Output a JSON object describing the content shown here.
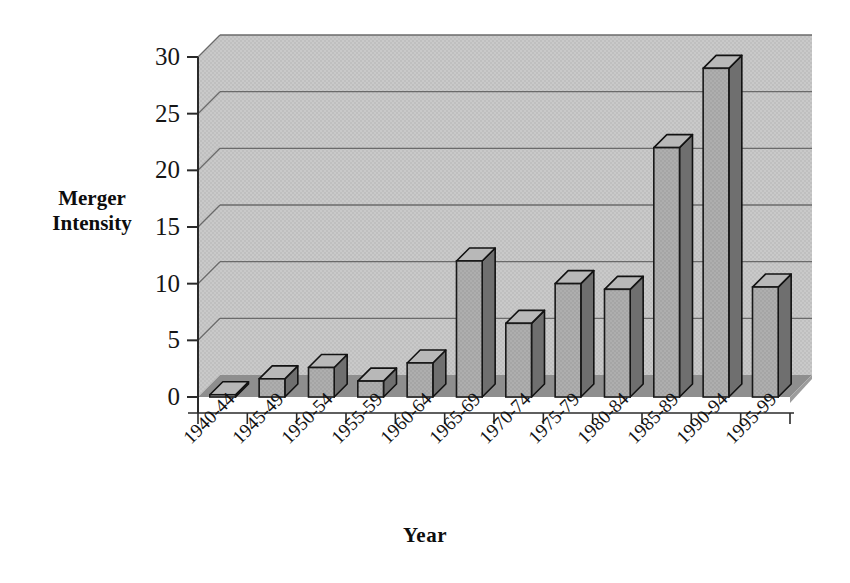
{
  "chart_data": {
    "type": "bar",
    "title": "",
    "subtitle": "",
    "xlabel": "Year",
    "ylabel": "Merger Intensity",
    "ylabel_lines": [
      "Merger",
      "Intensity"
    ],
    "categories": [
      "1940-44",
      "1945-49",
      "1950-54",
      "1955-59",
      "1960-64",
      "1965-69",
      "1970-74",
      "1975-79",
      "1980-84",
      "1985-89",
      "1990-94",
      "1995-99"
    ],
    "values": [
      0.2,
      1.6,
      2.6,
      1.4,
      3.0,
      12.0,
      6.5,
      10.0,
      9.5,
      22.0,
      29.0,
      9.7
    ],
    "ylim": [
      0,
      30
    ],
    "yticks": [
      0,
      5,
      10,
      15,
      20,
      25,
      30
    ],
    "ytick_labels": [
      "0",
      "5",
      "10",
      "15",
      "20",
      "25",
      "30"
    ],
    "grid": true,
    "grid_axis": "y",
    "legend": false,
    "legend_position": "none",
    "style": "3d-column",
    "series": [
      {
        "name": "Merger Intensity",
        "values": [
          0.2,
          1.6,
          2.6,
          1.4,
          3.0,
          12.0,
          6.5,
          10.0,
          9.5,
          22.0,
          29.0,
          9.7
        ]
      }
    ]
  },
  "colors": {
    "plot_background": "#c6c6c6",
    "floor": "#8e8e8e",
    "bar_face": "#a9a9a9",
    "bar_side": "#6f6f6f",
    "bar_top": "#b8b8b8",
    "bar_outline": "#121212",
    "gridline": "#6a6a6a",
    "axis_line": "#2a2a2a",
    "text": "#111111",
    "page_background": "#ffffff"
  }
}
